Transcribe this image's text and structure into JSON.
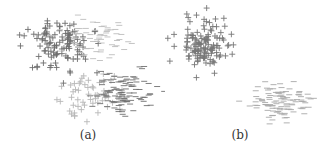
{
  "figure": {
    "panels": [
      {
        "id": "a",
        "caption": "(a)"
      },
      {
        "id": "b",
        "caption": "(b)"
      }
    ]
  },
  "chart_data": [
    {
      "type": "scatter",
      "title": "(a)",
      "xlabel": "",
      "ylabel": "",
      "grid": false,
      "axes": false,
      "legend": null,
      "marker_legend": {
        "+": "positive class",
        "-": "negative class"
      },
      "series": [
        {
          "name": "plus-dark",
          "marker": "+",
          "color": "#6e6e6e",
          "cx": 60,
          "cy": 45,
          "sx": 16,
          "sy": 14,
          "n": 110,
          "seed": 11
        },
        {
          "name": "minus-trail",
          "marker": "-",
          "color": "#bdbdbd",
          "cx": 95,
          "cy": 38,
          "sx": 16,
          "sy": 9,
          "n": 70,
          "seed": 23
        },
        {
          "name": "plus-light",
          "marker": "+",
          "color": "#b8b8b8",
          "cx": 90,
          "cy": 95,
          "sx": 14,
          "sy": 11,
          "n": 55,
          "seed": 37
        },
        {
          "name": "minus-dark",
          "marker": "-",
          "color": "#707070",
          "cx": 125,
          "cy": 92,
          "sx": 15,
          "sy": 10,
          "n": 110,
          "seed": 41
        }
      ]
    },
    {
      "type": "scatter",
      "title": "(b)",
      "xlabel": "",
      "ylabel": "",
      "grid": false,
      "axes": false,
      "legend": null,
      "series": [
        {
          "name": "plus",
          "marker": "+",
          "color": "#777777",
          "cx": 40,
          "cy": 45,
          "sx": 14,
          "sy": 13,
          "n": 130,
          "seed": 53
        },
        {
          "name": "minus",
          "marker": "-",
          "color": "#a8a8a8",
          "cx": 115,
          "cy": 100,
          "sx": 14,
          "sy": 9,
          "n": 110,
          "seed": 67
        }
      ]
    }
  ]
}
